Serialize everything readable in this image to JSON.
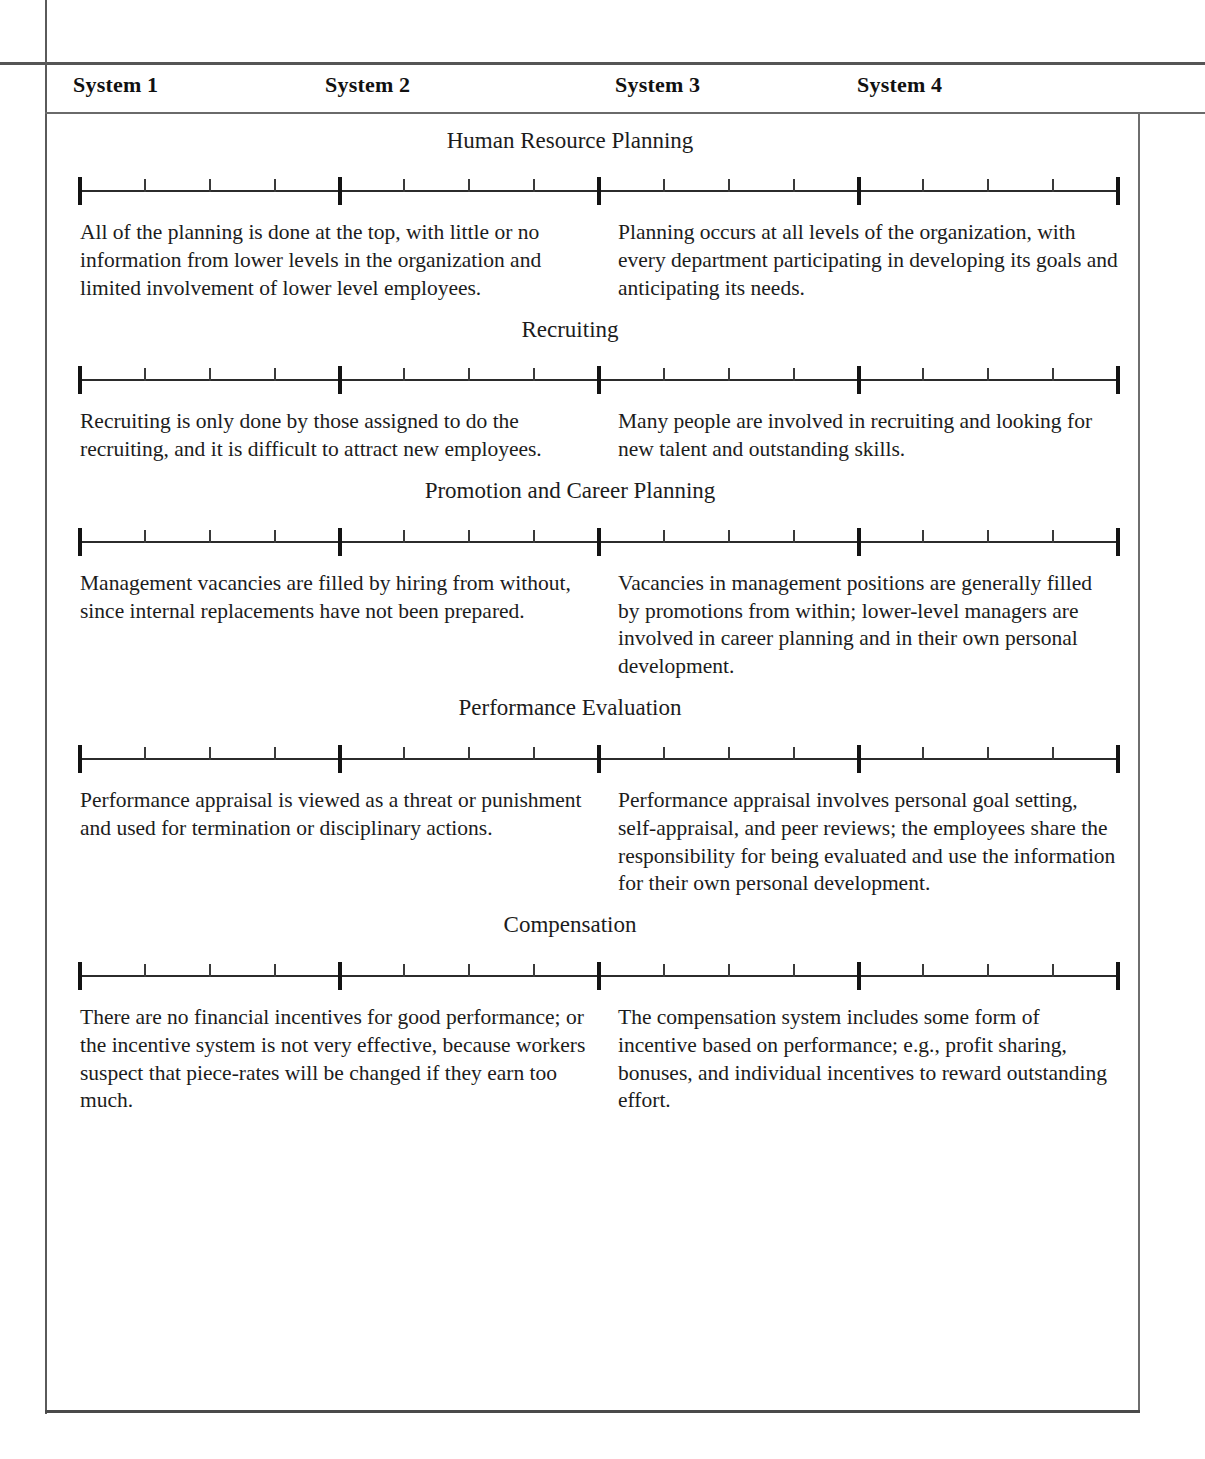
{
  "header": {
    "system_labels": [
      "System 1",
      "System 2",
      "System 3",
      "System 4"
    ]
  },
  "scale": {
    "major_divisions": 4,
    "minor_per_division": 3,
    "endpoints": [
      "System 1",
      "System 4"
    ]
  },
  "sections": [
    {
      "title": "Human Resource Planning",
      "left_description": "All of the planning is done at the top, with little or no information from lower levels in the organization and limited involvement of lower level employees.",
      "right_description": "Planning occurs at all levels of the organization, with every department participating in developing its goals and anticipating its needs."
    },
    {
      "title": "Recruiting",
      "left_description": "Recruiting is only done by those assigned to do the recruiting, and it is difficult to attract new employees.",
      "right_description": "Many people are involved in recruiting and looking for new talent and outstanding skills."
    },
    {
      "title": "Promotion and Career Planning",
      "left_description": "Management vacancies are filled by hiring from without, since internal replacements have not been prepared.",
      "right_description": "Vacancies in management positions are generally filled by promotions from within; lower-level managers are involved in career planning and in their own personal development."
    },
    {
      "title": "Performance Evaluation",
      "left_description": "Performance appraisal is viewed as a threat or punishment and used for termination or disciplinary actions.",
      "right_description": "Performance appraisal involves personal goal setting, self-appraisal, and peer reviews; the employees share the responsibility for being evaluated and use the information for their own personal development."
    },
    {
      "title": "Compensation",
      "left_description": "There are no financial incentives for good performance; or the incentive system is not very effective, because workers suspect that piece-rates will be changed if they earn too much.",
      "right_description": "The compensation system includes some form of incentive based on performance; e.g., profit sharing, bonuses, and individual incentives to reward outstanding effort."
    }
  ]
}
